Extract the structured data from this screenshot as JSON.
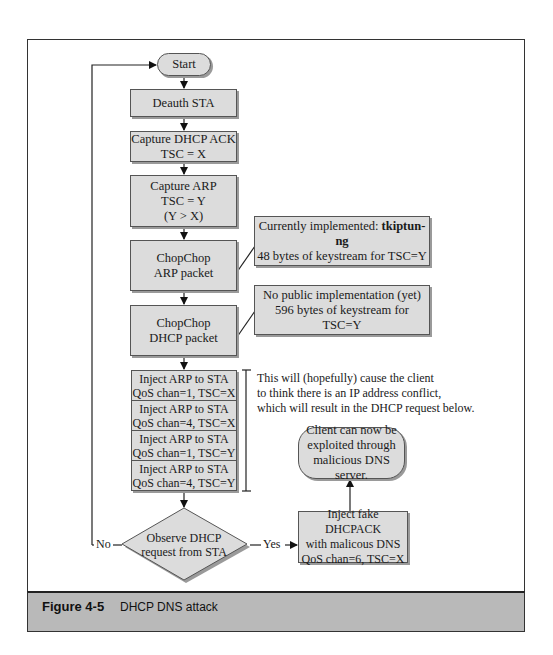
{
  "figure": {
    "number": "Figure 4-5",
    "caption": "DHCP DNS attack"
  },
  "nodes": {
    "start": "Start",
    "deauth": "Deauth STA",
    "capture_ack": {
      "line1": "Capture DHCP ACK",
      "line2": "TSC = X"
    },
    "capture_arp": {
      "line1": "Capture ARP",
      "line2": "TSC = Y",
      "line3": "(Y > X)"
    },
    "chopchop_arp": {
      "line1": "ChopChop",
      "line2": "ARP packet"
    },
    "chopchop_dhcp": {
      "line1": "ChopChop",
      "line2": "DHCP packet"
    },
    "inject_rows": [
      {
        "line1": "Inject ARP to STA",
        "line2": "QoS chan=1, TSC=X"
      },
      {
        "line1": "Inject ARP to STA",
        "line2": "QoS chan=4, TSC=X"
      },
      {
        "line1": "Inject ARP to STA",
        "line2": "QoS chan=1, TSC=Y"
      },
      {
        "line1": "Inject ARP to STA",
        "line2": "QoS chan=4, TSC=Y"
      }
    ],
    "decision": {
      "line1": "Observe DHCP",
      "line2": "request from STA"
    },
    "inject_fake": {
      "line1": "Inject fake DHCPACK",
      "line2": "with malicous DNS",
      "line3": "QoS chan=6, TSC=X"
    },
    "client": {
      "line1": "Client can now be",
      "line2": "exploited through",
      "line3": "malicious DNS server."
    }
  },
  "callouts": {
    "arp": {
      "prefix": "Currently implemented: ",
      "tool": "tkiptun-ng",
      "line2": "48 bytes of keystream for TSC=Y"
    },
    "dhcp": {
      "line1": "No public implementation (yet)",
      "line2": "596 bytes of keystream for TSC=Y"
    }
  },
  "note": {
    "line1": "This will (hopefully) cause the client",
    "line2": "to think there is an IP address conflict,",
    "line3": "which will result in the DHCP request below."
  },
  "edges": {
    "no_label": "No",
    "yes_label": "Yes"
  }
}
